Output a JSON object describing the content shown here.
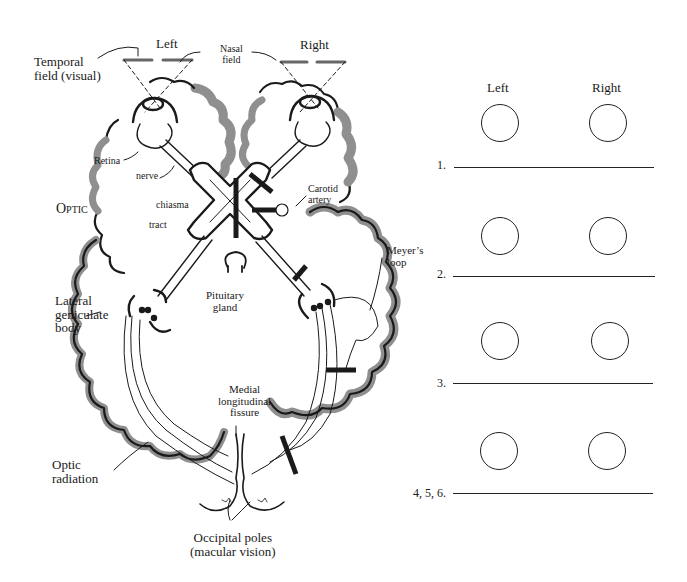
{
  "diagram": {
    "labels": {
      "left": "Left",
      "right": "Right",
      "temporal_field_line1": "Temporal",
      "temporal_field_line2": "field (visual)",
      "nasal_field_line1": "Nasal",
      "nasal_field_line2": "field",
      "retina": "Retina",
      "nerve": "nerve",
      "optic": "Optic",
      "chiasma": "chiasma",
      "tract": "tract",
      "carotid_line1": "Carotid",
      "carotid_line2": "artery",
      "meyers_line1": "Meyer’s",
      "meyers_line2": "loop",
      "lgb_line1": "Lateral",
      "lgb_line2": "geniculate",
      "lgb_line3": "body",
      "pituitary_line1": "Pituitary",
      "pituitary_line2": "gland",
      "medial_line1": "Medial",
      "medial_line2": "longitudinal",
      "medial_line3": "fissure",
      "optic_rad_line1": "Optic",
      "optic_rad_line2": "radiation",
      "occipital_line1": "Occipital poles",
      "occipital_line2": "(macular vision)"
    },
    "colors": {
      "cortex_shade": "#8f8f8f",
      "ink": "#1a1a1a"
    }
  },
  "worksheet": {
    "col_left": "Left",
    "col_right": "Right",
    "rows": [
      {
        "number": "1."
      },
      {
        "number": "2."
      },
      {
        "number": "3."
      },
      {
        "number": "4, 5, 6."
      }
    ]
  }
}
